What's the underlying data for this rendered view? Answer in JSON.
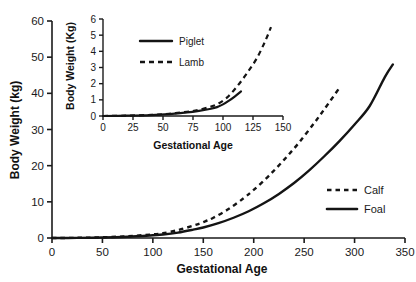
{
  "chart_data": [
    {
      "id": "main",
      "type": "line",
      "title": "",
      "xlabel": "Gestational Age",
      "ylabel": "Body Weight (kg)",
      "xlim": [
        0,
        350
      ],
      "ylim": [
        0,
        60
      ],
      "xticks": [
        0,
        50,
        100,
        150,
        200,
        250,
        300,
        350
      ],
      "yticks": [
        0,
        10,
        20,
        30,
        40,
        50,
        60
      ],
      "grid": false,
      "legend_position": "inside-right",
      "series": [
        {
          "name": "Calf",
          "style": "dashed",
          "color": "#141414",
          "x": [
            0,
            25,
            50,
            75,
            100,
            110,
            125,
            140,
            150,
            160,
            175,
            190,
            200,
            215,
            230,
            245,
            260,
            270,
            285
          ],
          "y": [
            0.0,
            0.05,
            0.2,
            0.5,
            1.0,
            1.3,
            2.2,
            3.4,
            4.4,
            5.6,
            8.0,
            11.0,
            13.3,
            17.2,
            21.6,
            26.4,
            31.8,
            35.6,
            41.5
          ]
        },
        {
          "name": "Foal",
          "style": "solid",
          "color": "#141414",
          "x": [
            0,
            25,
            50,
            75,
            100,
            110,
            125,
            140,
            150,
            165,
            180,
            195,
            210,
            225,
            240,
            255,
            270,
            285,
            300,
            315,
            330,
            338
          ],
          "y": [
            0.0,
            0.03,
            0.12,
            0.35,
            0.75,
            0.95,
            1.5,
            2.3,
            2.9,
            4.1,
            5.6,
            7.4,
            9.6,
            12.2,
            15.2,
            18.7,
            22.6,
            26.8,
            31.4,
            36.5,
            44.5,
            48.0
          ]
        }
      ]
    },
    {
      "id": "inset",
      "type": "line",
      "title": "",
      "xlabel": "Gestational Age",
      "ylabel": "Body Weight (Kg)",
      "xlim": [
        0,
        150
      ],
      "ylim": [
        0,
        6
      ],
      "xticks": [
        0,
        25,
        50,
        75,
        100,
        125,
        150
      ],
      "yticks": [
        0,
        1,
        2,
        3,
        4,
        5,
        6
      ],
      "grid": false,
      "legend_position": "inside-top-left",
      "series": [
        {
          "name": "Piglet",
          "style": "solid",
          "color": "#141414",
          "x": [
            0,
            20,
            40,
            55,
            70,
            80,
            90,
            95,
            100,
            105,
            110,
            115
          ],
          "y": [
            0.0,
            0.02,
            0.06,
            0.12,
            0.22,
            0.32,
            0.45,
            0.55,
            0.72,
            0.95,
            1.22,
            1.52
          ]
        },
        {
          "name": "Lamb",
          "style": "dashed",
          "color": "#141414",
          "x": [
            0,
            20,
            40,
            55,
            70,
            80,
            90,
            95,
            100,
            105,
            112,
            120,
            128,
            135,
            140
          ],
          "y": [
            0.0,
            0.02,
            0.07,
            0.14,
            0.26,
            0.38,
            0.58,
            0.72,
            0.95,
            1.25,
            1.85,
            2.65,
            3.55,
            4.6,
            5.5
          ]
        }
      ]
    }
  ]
}
